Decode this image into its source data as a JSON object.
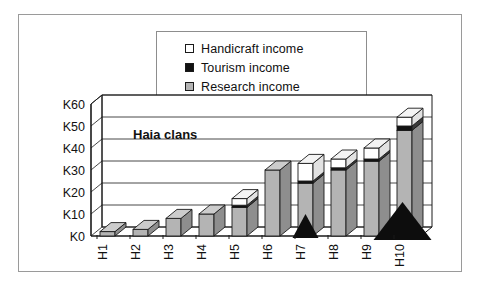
{
  "chart_data": {
    "type": "bar",
    "subtype": "stacked-3d-column",
    "title": "",
    "annotation": "Haia clans",
    "xlabel": "",
    "ylabel": "",
    "categories": [
      "H1",
      "H2",
      "H3",
      "H4",
      "H5",
      "H6",
      "H7",
      "H8",
      "H9",
      "H10"
    ],
    "series": [
      {
        "name": "Research income",
        "color": "#b4b4b4",
        "values": [
          2,
          3,
          8,
          10,
          13,
          30,
          24,
          30,
          34,
          48
        ]
      },
      {
        "name": "Tourism income",
        "color": "#121212",
        "values": [
          0,
          0,
          0,
          0,
          1,
          0,
          1,
          1,
          1,
          2
        ]
      },
      {
        "name": "Handicraft income",
        "color": "#ffffff",
        "values": [
          0,
          0,
          0,
          0,
          3,
          0,
          8,
          4,
          5,
          4
        ]
      }
    ],
    "ylim": [
      0,
      60
    ],
    "ytick_values": [
      0,
      10,
      20,
      30,
      40,
      50,
      60
    ],
    "ytick_labels": [
      "K0",
      "K10",
      "K20",
      "K30",
      "K40",
      "K50",
      "K60"
    ],
    "grid": true,
    "legend_position": "top-center",
    "xtick_rotation": 90,
    "artifacts": [
      "black-triangle-H7",
      "black-triangle-H10"
    ]
  },
  "legend": {
    "items": [
      {
        "label": "Handicraft income",
        "swatch": "white"
      },
      {
        "label": "Tourism income",
        "swatch": "black"
      },
      {
        "label": "Research income",
        "swatch": "gray"
      }
    ]
  }
}
